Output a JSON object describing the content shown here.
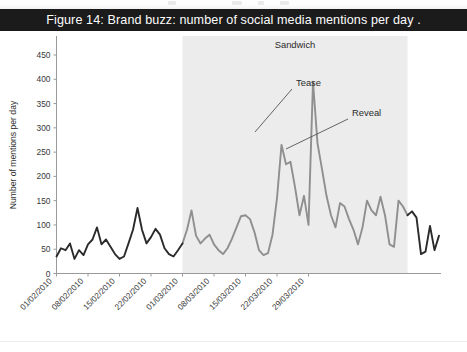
{
  "caption": {
    "text": "Figure 14: Brand buzz: number of social media mentions per day ."
  },
  "chart_data": {
    "type": "line",
    "title": "Figure 14: Brand buzz: number of social media mentions per day .",
    "xlabel": "",
    "ylabel": "Number of mentions per day",
    "ylim": [
      0,
      450
    ],
    "ytick_labels": [
      "0",
      "50",
      "100",
      "150",
      "200",
      "250",
      "300",
      "350",
      "400",
      "450"
    ],
    "yticks": [
      0,
      50,
      100,
      150,
      200,
      250,
      300,
      350,
      400,
      450
    ],
    "xtick_labels": [
      "01/02/2010",
      "08/02/2010",
      "15/02/2010",
      "22/02/2010",
      "01/03/2010",
      "08/03/2010",
      "15/03/2010",
      "22/03/2010",
      "29/03/2010"
    ],
    "x_start": "01/02/2010",
    "x_end": "04/04/2010",
    "grid": false,
    "legend": "none",
    "series": [
      {
        "name": "Mentions per day",
        "color_before_campaign": "#2b2b2b",
        "color_during_campaign": "#8c8c8c",
        "values": [
          35,
          52,
          48,
          62,
          30,
          48,
          38,
          60,
          70,
          95,
          60,
          70,
          55,
          40,
          30,
          35,
          62,
          90,
          135,
          90,
          62,
          75,
          92,
          80,
          52,
          40,
          35,
          48,
          62,
          90,
          130,
          78,
          62,
          72,
          80,
          60,
          48,
          40,
          52,
          72,
          95,
          118,
          120,
          112,
          85,
          48,
          38,
          42,
          80,
          155,
          265,
          225,
          230,
          178,
          120,
          160,
          100,
          395,
          268,
          215,
          160,
          120,
          95,
          145,
          138,
          112,
          90,
          60,
          95,
          150,
          130,
          120,
          158,
          120,
          60,
          55,
          150,
          138,
          120,
          128,
          115,
          40,
          45,
          98,
          48,
          78
        ]
      }
    ],
    "shaded_region": {
      "label": "Sandwich",
      "start": "01/03/2010",
      "end": "01/04/2010",
      "fill": "#ececec"
    },
    "annotations": [
      {
        "label": "Tease",
        "points_to_date": "07/03/2010",
        "points_to_value": 265
      },
      {
        "label": "Reveal",
        "points_to_date": "11/03/2010",
        "points_to_value": 215
      }
    ]
  },
  "axis": {
    "y_title": "Number of mentions per day"
  },
  "annotations": {
    "sandwich": "Sandwich",
    "tease": "Tease",
    "reveal": "Reveal"
  }
}
